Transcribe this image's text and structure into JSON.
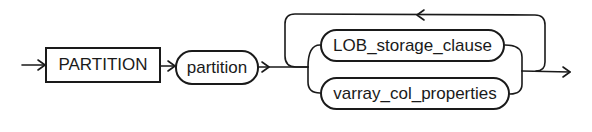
{
  "diagram": {
    "type": "railroad-syntax-diagram",
    "keyword": {
      "label": "PARTITION"
    },
    "nonterminal": {
      "label": "partition"
    },
    "choices": [
      {
        "label": "LOB_storage_clause"
      },
      {
        "label": "varray_col_properties"
      }
    ],
    "loop": {
      "direction": "repeat",
      "arrow": "left"
    },
    "colors": {
      "stroke": "#1a1a1a",
      "background": "#ffffff"
    }
  }
}
